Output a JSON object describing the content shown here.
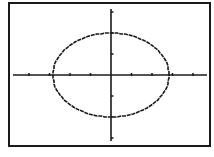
{
  "screen": {
    "background": "#ffffff",
    "ink": "#1a1a1a",
    "frame": {
      "left": 9,
      "top": 3,
      "right": 210,
      "bottom": 146
    }
  },
  "chart_data": {
    "type": "line",
    "title": "",
    "xlabel": "",
    "ylabel": "",
    "equation": "x^2/8 + y^2/4 = 1",
    "x_radius": 2.83,
    "y_radius": 2,
    "center": [
      0,
      0
    ],
    "xlim": [
      -4.8,
      4.8
    ],
    "ylim": [
      -3.4,
      3.4
    ],
    "x_ticks": [
      -4,
      -3,
      -2,
      -1,
      1,
      2,
      3,
      4
    ],
    "y_ticks": [
      -3,
      -2,
      -1,
      1,
      2,
      3
    ],
    "grid": false,
    "legend": null
  }
}
